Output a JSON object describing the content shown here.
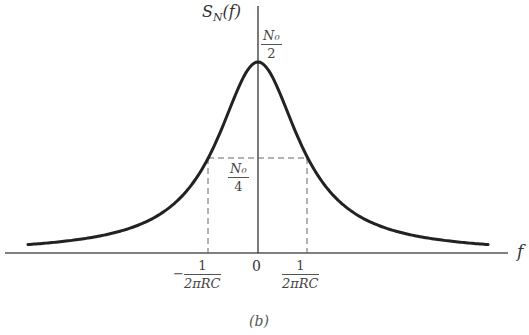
{
  "figure": {
    "caption": "(b)",
    "y_axis_label": "S_N(f)",
    "y_axis_label_main": "S",
    "y_axis_label_sub": "N",
    "y_axis_label_arg": "(f)",
    "x_axis_label": "f",
    "peak_label": {
      "numerator": "N₀",
      "denominator": "2"
    },
    "half_label": {
      "numerator": "N₀",
      "denominator": "4"
    },
    "origin_label": "0",
    "neg_cutoff": {
      "sign": "−",
      "numerator": "1",
      "denominator": "2πRC"
    },
    "pos_cutoff": {
      "numerator": "1",
      "denominator": "2πRC"
    }
  },
  "chart_data": {
    "type": "line",
    "xlabel": "f",
    "ylabel": "S_N(f)",
    "function": "S_N(f) = (N0/2) / (1 + (2πfRC)^2)",
    "peak_value": "N0/2",
    "half_power_value": "N0/4",
    "half_power_frequencies": [
      "-1/(2πRC)",
      "1/(2πRC)"
    ],
    "x_ticks": [
      "-1/(2πRC)",
      "0",
      "1/(2πRC)"
    ],
    "y_ticks": [
      "N0/4",
      "N0/2"
    ],
    "grid": false,
    "annotations": [
      "dashed lines mark half-power points at N0/4"
    ]
  }
}
